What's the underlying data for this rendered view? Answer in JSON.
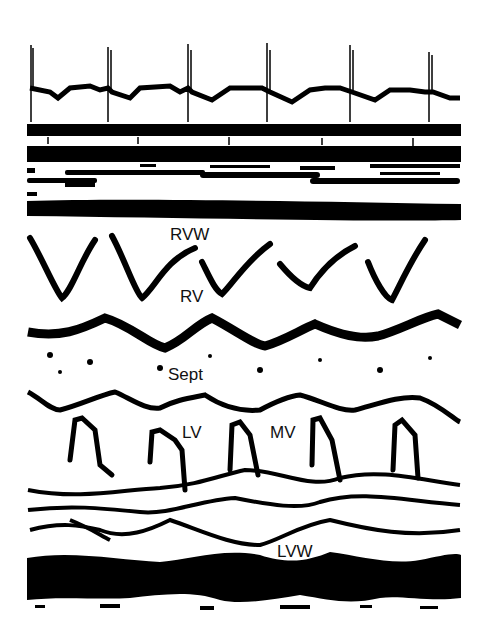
{
  "figure": {
    "type": "M-mode echocardiogram",
    "ecg_beats": 6,
    "labels": {
      "rvw": "RVW",
      "rv": "RV",
      "sept": "Sept",
      "lv": "LV",
      "mv": "MV",
      "lvw": "LVW"
    },
    "colors": {
      "trace": "#000000",
      "background": "#ffffff"
    }
  }
}
